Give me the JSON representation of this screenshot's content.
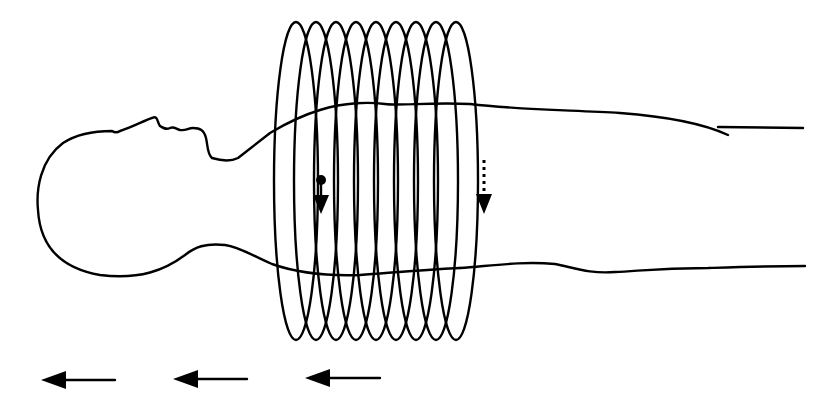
{
  "diagram": {
    "colors": {
      "line": "#000000",
      "background": "#ffffff"
    },
    "figure": {
      "name": "patient-outline",
      "orientation": "supine, head to left"
    },
    "coil": {
      "name": "helical-coil",
      "loop_count": 9,
      "first_center_x": 296,
      "spacing": 20,
      "top_y": 22,
      "bottom_y": 340,
      "rx": 22
    },
    "indicators": {
      "start_arrow": {
        "name": "rotation-start-arrow",
        "style": "solid",
        "direction": "down"
      },
      "end_arrow": {
        "name": "rotation-end-arrow",
        "style": "dotted",
        "direction": "down"
      }
    },
    "motion_arrows": {
      "label": "table motion direction",
      "direction": "left",
      "count": 3
    }
  }
}
